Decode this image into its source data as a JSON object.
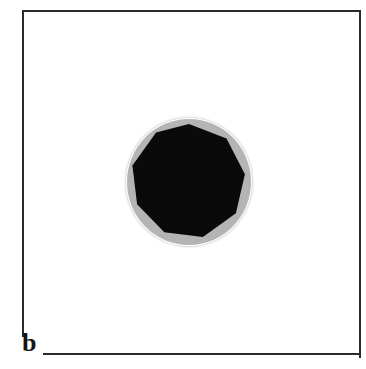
{
  "figure": {
    "width": 366,
    "height": 369,
    "background_color": "#ffffff",
    "panel_label": "b",
    "frame": {
      "color": "#2b2b2b",
      "stroke_px": 2,
      "name": "rectangular-border"
    },
    "object": {
      "name": "faceted-particle",
      "halo": {
        "shape": "circle",
        "color": "#b4b4b4",
        "center_x": 189,
        "center_y": 182,
        "radius_x": 62,
        "radius_y": 63
      },
      "core": {
        "shape": "polygon",
        "sides": 9,
        "color": "#0a0a0a",
        "center_x": 189,
        "center_y": 182,
        "radius": 58,
        "top_vertex_x": 189,
        "top_vertex_y": 125,
        "bottom_vertex_y": 240,
        "polygon_points": "58,0 95.5,14.5 113.9,50.2 104.9,89.2 71.9,112.9 33.3,108.3 6.1,80.3 1.4,41.6 25.1,8.6"
      }
    }
  }
}
